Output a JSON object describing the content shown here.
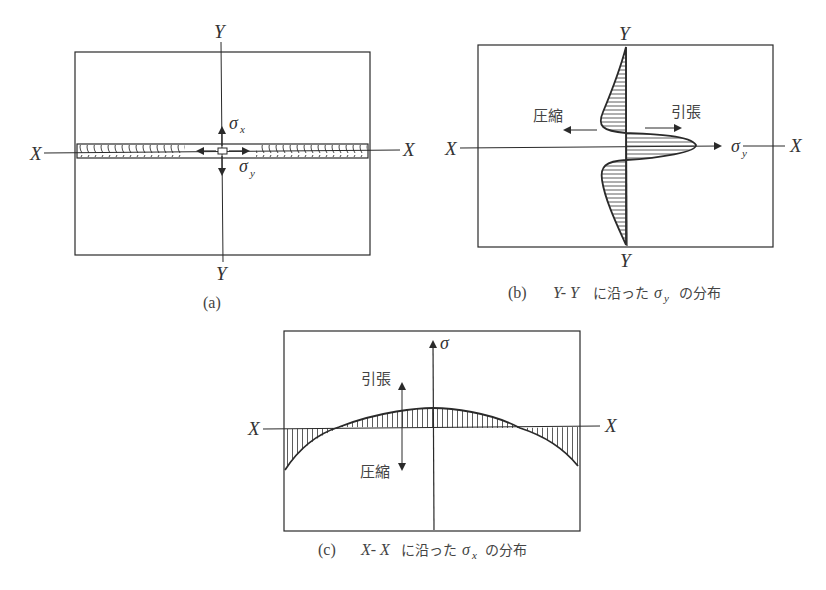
{
  "panel_a": {
    "axis_x_left": "X",
    "axis_x_right": "X",
    "axis_y_top": "Y",
    "axis_y_bottom": "Y",
    "sigma_x": "σ",
    "sigma_x_sub": "x",
    "sigma_y": "σ",
    "sigma_y_sub": "y",
    "caption": "(a)"
  },
  "panel_b": {
    "axis_x_left": "X",
    "axis_x_right": "X",
    "axis_y_top": "Y",
    "axis_y_bottom": "Y",
    "compression_label": "圧縮",
    "tension_label": "引張",
    "sigma_y": "σ",
    "sigma_y_sub": "y",
    "caption_prefix": "(b)",
    "caption_axis": "Y- Y",
    "caption_mid": "に沿った",
    "caption_sigma": "σ",
    "caption_sigma_sub": "y",
    "caption_suffix": "の分布"
  },
  "panel_c": {
    "axis_x_left": "X",
    "axis_x_right": "X",
    "sigma": "σ",
    "tension_label": "引張",
    "compression_label": "圧縮",
    "caption_prefix": "(c)",
    "caption_axis": "X- X",
    "caption_mid": "に沿った",
    "caption_sigma": "σ",
    "caption_sigma_sub": "x",
    "caption_suffix": "の分布"
  },
  "colors": {
    "line": "#2a2a2a",
    "text": "#444444",
    "background": "#ffffff"
  }
}
